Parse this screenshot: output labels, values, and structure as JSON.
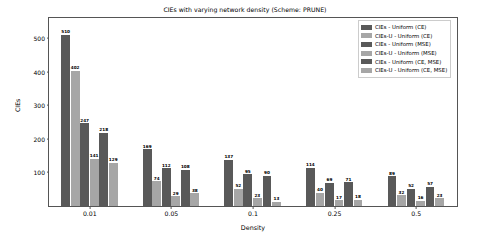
{
  "chart_data": {
    "type": "bar",
    "title": "CIEs with varying network density (Scheme: PRUNE)",
    "xlabel": "Density",
    "ylabel": "CIEs",
    "categories": [
      "0.01",
      "0.05",
      "0.1",
      "0.25",
      "0.5"
    ],
    "ylim": [
      0,
      560
    ],
    "yticks": [
      100,
      200,
      300,
      400,
      500
    ],
    "grid": false,
    "legend_position": "upper right",
    "series": [
      {
        "name": "CIEs - Uniform (CE)",
        "color": "#595959",
        "values": [
          510,
          169,
          137,
          114,
          89
        ]
      },
      {
        "name": "CIEs-U - Uniform (CE)",
        "color": "#a6a6a6",
        "values": [
          402,
          74,
          52,
          40,
          32
        ]
      },
      {
        "name": "CIEs - Uniform (MSE)",
        "color": "#595959",
        "values": [
          247,
          112,
          95,
          69,
          52
        ]
      },
      {
        "name": "CIEs-U - Uniform (MSE)",
        "color": "#a6a6a6",
        "values": [
          141,
          29,
          23,
          17,
          16
        ]
      },
      {
        "name": "CIEs - Uniform (CE, MSE)",
        "color": "#595959",
        "values": [
          218,
          108,
          90,
          71,
          57
        ]
      },
      {
        "name": "CIEs-U - Uniform (CE, MSE)",
        "color": "#a6a6a6",
        "values": [
          129,
          38,
          13,
          18,
          23
        ]
      }
    ]
  }
}
